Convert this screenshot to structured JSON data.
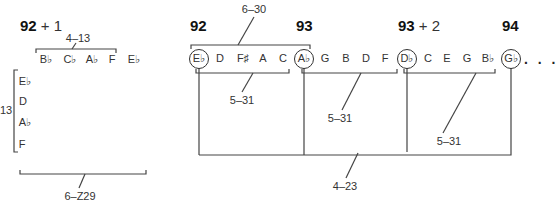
{
  "left_panel": {
    "measure_label": {
      "num": "92",
      "suffix": "+ 1"
    },
    "row_set_label": "4–13",
    "row_notes": [
      "B♭",
      "C♭",
      "A♭",
      "F"
    ],
    "row_extra_note": "E♭",
    "column_notes": [
      "E♭",
      "D",
      "A♭",
      "F"
    ],
    "column_set_label": "13",
    "combined_set_label": "6–Z29"
  },
  "right_panel": {
    "measure_labels": [
      {
        "num": "92",
        "suffix": ""
      },
      {
        "num": "93",
        "suffix": ""
      },
      {
        "num": "93",
        "suffix": "+ 2"
      },
      {
        "num": "94",
        "suffix": ""
      }
    ],
    "notes": [
      "E♭",
      "D",
      "F♯",
      "A",
      "C",
      "A♭",
      "G",
      "B",
      "D",
      "F",
      "D♭",
      "C",
      "E",
      "G",
      "B♭",
      "G♭"
    ],
    "circled_notes": [
      "E♭",
      "A♭",
      "D♭",
      "G♭"
    ],
    "continuation": ". . .",
    "set_labels": {
      "top_bracket": "6–30",
      "group1": "5–31",
      "group2": "5–31",
      "group3": "5–31",
      "circled_bracket": "4–23"
    }
  }
}
